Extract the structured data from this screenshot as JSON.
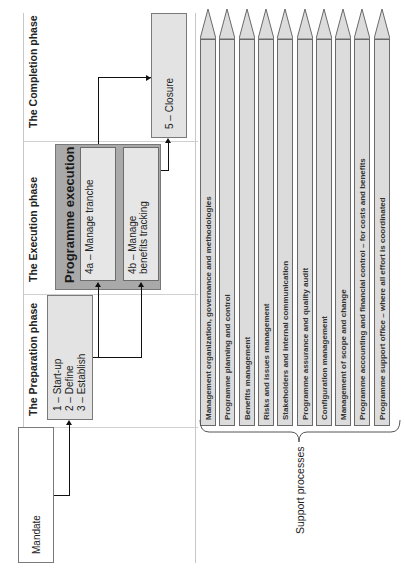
{
  "orientation": "rotated-90-ccw",
  "phases": [
    {
      "id": "preparation",
      "title": "The Preparation phase"
    },
    {
      "id": "execution",
      "title": "The Execution phase"
    },
    {
      "id": "completion",
      "title": "The Completion phase"
    }
  ],
  "mandate": {
    "label": "Mandate"
  },
  "preparation_box": {
    "lines": [
      "1 – Start-up",
      "2 – Define",
      "3 – Establish"
    ]
  },
  "programme_execution": {
    "title": "Programme execution",
    "sub_boxes": [
      {
        "label": "4a – Manage tranche"
      },
      {
        "label": "4b – Manage benefits tracking"
      }
    ]
  },
  "closure": {
    "label": "5 – Closure"
  },
  "support_processes": {
    "label": "Support processes",
    "items": [
      "Management organization, governance and methodologies",
      "Programme planning and control",
      "Benefits management",
      "Risks and issues management",
      "Stakeholders and internal communication",
      "Programme assurance and quality audit",
      "Configuration management",
      "Management of scope and change",
      "Programme accounting and financial control – for costs and benefits",
      "Programme support office – where all effort is coordinated"
    ]
  },
  "colors": {
    "box_fill": "#e3e3e3",
    "execution_fill": "#a9a9a9",
    "pencil_fill": "#dcdcdc",
    "border": "#7a7a7a",
    "connector": "#111111"
  }
}
